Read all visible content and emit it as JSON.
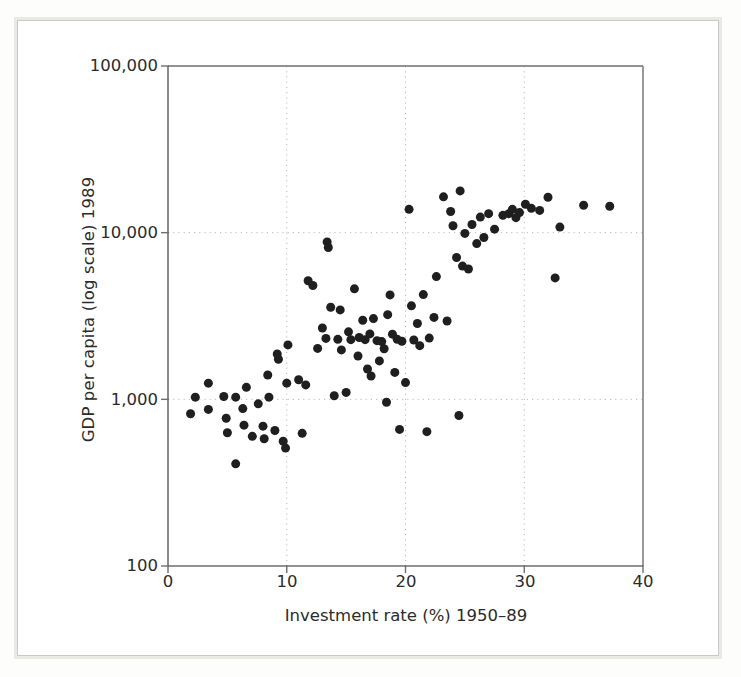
{
  "figure": {
    "type": "scatter-plot",
    "background": "#ffffff",
    "point_color": "#1f1f1f",
    "axis_color": "#6e6e6e",
    "grid_color": "#b9b9b9"
  },
  "axes": {
    "y_label": "GDP per capita (log scale) 1989",
    "x_label": "Investment rate (%) 1950–89",
    "y_ticks": [
      "100,000",
      "10,000",
      "1,000",
      "100"
    ],
    "x_ticks": [
      "0",
      "10",
      "20",
      "30",
      "40"
    ]
  },
  "chart_data": {
    "type": "scatter",
    "title": "",
    "xlabel": "Investment rate (%) 1950–89",
    "ylabel": "GDP per capita (log scale) 1989",
    "xlim": [
      0,
      40
    ],
    "ylim": [
      100,
      100000
    ],
    "yscale": "log",
    "xscale": "linear",
    "grid": true,
    "gridlines_x": [
      10,
      20,
      30
    ],
    "gridlines_y": [
      1000,
      10000
    ],
    "legend": null,
    "xtick_values": [
      0,
      10,
      20,
      30,
      40
    ],
    "ytick_values": [
      100,
      1000,
      10000,
      100000
    ],
    "ytick_labels": [
      "100",
      "1,000",
      "10,000",
      "100,000"
    ],
    "marker": "circle",
    "marker_size_px": 9,
    "n_points": 103,
    "points": [
      [
        1.9,
        820
      ],
      [
        2.3,
        1030
      ],
      [
        3.4,
        1250
      ],
      [
        3.4,
        870
      ],
      [
        4.7,
        1040
      ],
      [
        4.9,
        770
      ],
      [
        5.0,
        630
      ],
      [
        5.7,
        410
      ],
      [
        5.7,
        1030
      ],
      [
        6.3,
        880
      ],
      [
        6.4,
        700
      ],
      [
        6.6,
        1180
      ],
      [
        7.1,
        600
      ],
      [
        7.6,
        940
      ],
      [
        8.0,
        690
      ],
      [
        8.1,
        580
      ],
      [
        8.4,
        1400
      ],
      [
        8.5,
        1030
      ],
      [
        9.0,
        650
      ],
      [
        9.2,
        1870
      ],
      [
        9.3,
        1740
      ],
      [
        9.7,
        560
      ],
      [
        9.9,
        510
      ],
      [
        10.0,
        1250
      ],
      [
        10.1,
        2120
      ],
      [
        11.0,
        1310
      ],
      [
        11.3,
        625
      ],
      [
        11.6,
        1220
      ],
      [
        11.8,
        5150
      ],
      [
        12.2,
        4820
      ],
      [
        12.6,
        2020
      ],
      [
        13.0,
        2680
      ],
      [
        13.3,
        2320
      ],
      [
        13.4,
        8800
      ],
      [
        13.5,
        8150
      ],
      [
        13.7,
        3570
      ],
      [
        14.0,
        1050
      ],
      [
        14.3,
        2290
      ],
      [
        14.5,
        3440
      ],
      [
        14.6,
        1980
      ],
      [
        15.0,
        1100
      ],
      [
        15.2,
        2540
      ],
      [
        15.4,
        2280
      ],
      [
        15.7,
        4600
      ],
      [
        16.0,
        1820
      ],
      [
        16.1,
        2350
      ],
      [
        16.4,
        2980
      ],
      [
        16.6,
        2280
      ],
      [
        16.8,
        1520
      ],
      [
        17.0,
        2470
      ],
      [
        17.1,
        1380
      ],
      [
        17.3,
        3050
      ],
      [
        17.6,
        2250
      ],
      [
        17.8,
        1700
      ],
      [
        18.0,
        2220
      ],
      [
        18.2,
        2010
      ],
      [
        18.4,
        960
      ],
      [
        18.5,
        3220
      ],
      [
        18.7,
        4230
      ],
      [
        18.9,
        2460
      ],
      [
        19.1,
        1450
      ],
      [
        19.3,
        2290
      ],
      [
        19.5,
        660
      ],
      [
        19.7,
        2230
      ],
      [
        20.0,
        1260
      ],
      [
        20.3,
        13800
      ],
      [
        20.5,
        3640
      ],
      [
        20.7,
        2270
      ],
      [
        21.0,
        2850
      ],
      [
        21.2,
        2100
      ],
      [
        21.5,
        4250
      ],
      [
        21.8,
        640
      ],
      [
        22.0,
        2330
      ],
      [
        22.4,
        3100
      ],
      [
        22.6,
        5450
      ],
      [
        23.2,
        16400
      ],
      [
        23.5,
        2950
      ],
      [
        23.8,
        13400
      ],
      [
        24.0,
        11000
      ],
      [
        24.3,
        7100
      ],
      [
        24.5,
        800
      ],
      [
        24.6,
        17800
      ],
      [
        24.8,
        6300
      ],
      [
        25.0,
        9900
      ],
      [
        25.3,
        6050
      ],
      [
        25.6,
        11200
      ],
      [
        26.0,
        8600
      ],
      [
        26.3,
        12400
      ],
      [
        26.6,
        9350
      ],
      [
        27.0,
        13000
      ],
      [
        27.5,
        10500
      ],
      [
        28.2,
        12700
      ],
      [
        28.7,
        13000
      ],
      [
        29.0,
        13800
      ],
      [
        29.3,
        12300
      ],
      [
        29.6,
        13200
      ],
      [
        30.1,
        14800
      ],
      [
        30.6,
        14000
      ],
      [
        31.3,
        13600
      ],
      [
        32.0,
        16300
      ],
      [
        32.6,
        5350
      ],
      [
        33.0,
        10800
      ],
      [
        35.0,
        14600
      ],
      [
        37.2,
        14400
      ]
    ]
  }
}
